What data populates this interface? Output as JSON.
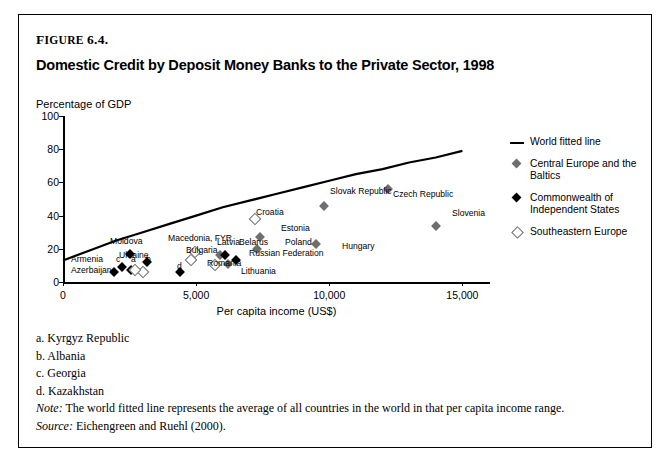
{
  "figure": {
    "number_prefix": "F",
    "number_rest": "IGURE",
    "number": "6.4.",
    "title": "Domestic Credit by Deposit Money Banks to the Private Sector, 1998"
  },
  "footnotes": [
    "a. Kyrgyz Republic",
    "b. Albania",
    "c. Georgia",
    "d. Kazakhstan"
  ],
  "note_label": "Note:",
  "note_text": " The world fitted line represents the average of all countries in the world in that per capita income range.",
  "source_label": "Source:",
  "source_text": " Eichengreen and Ruehl (2000).",
  "colors": {
    "central_europe": "#6e6e6e",
    "cis": "#000000",
    "southeastern_europe": "#ffffff",
    "southeastern_europe_border": "#6b6b6b",
    "fitted_line": "#000000"
  },
  "chart_data": {
    "type": "scatter",
    "title": "Domestic Credit by Deposit Money Banks to the Private Sector, 1998",
    "ylabel": "Percentage of GDP",
    "xlabel": "Per capita income (US$)",
    "xlim": [
      0,
      16000
    ],
    "ylim": [
      0,
      100
    ],
    "xticks": [
      0,
      5000,
      10000,
      15000
    ],
    "xticklabels": [
      "0",
      "5,000",
      "10,000",
      "15,000"
    ],
    "yticks": [
      0,
      20,
      40,
      60,
      80,
      100
    ],
    "yticklabels": [
      "0",
      "20",
      "40",
      "60",
      "80",
      "100"
    ],
    "grid": false,
    "legend_position": "right",
    "legend": [
      {
        "name": "World fitted line",
        "marker": "line"
      },
      {
        "name": "Central Europe and the Baltics",
        "marker": "diamond-gray"
      },
      {
        "name": "Commonwealth of Independent States",
        "marker": "diamond-black"
      },
      {
        "name": "Southeastern Europe",
        "marker": "diamond-open"
      }
    ],
    "fitted_line": {
      "name": "World fitted line",
      "x": [
        0,
        1000,
        2000,
        3000,
        4000,
        5000,
        6000,
        7000,
        8000,
        9000,
        10000,
        11000,
        12000,
        13000,
        14000,
        15000
      ],
      "y": [
        13,
        19,
        25,
        30,
        35,
        40,
        45,
        49,
        53,
        57,
        61,
        65,
        68,
        72,
        75,
        79
      ]
    },
    "series": [
      {
        "name": "Central Europe and the Baltics",
        "marker": "diamond-gray",
        "points": [
          {
            "label": "Latvia",
            "x": 5900,
            "y": 16
          },
          {
            "label": "Poland",
            "x": 7300,
            "y": 20
          },
          {
            "label": "Estonia",
            "x": 7400,
            "y": 27
          },
          {
            "label": "Hungary",
            "x": 9500,
            "y": 23
          },
          {
            "label": "Slovak Republic",
            "x": 9800,
            "y": 46
          },
          {
            "label": "Czech Republic",
            "x": 12200,
            "y": 56
          },
          {
            "label": "Slovenia",
            "x": 14000,
            "y": 34
          },
          {
            "label": "Lithuania",
            "x": 6200,
            "y": 11
          }
        ]
      },
      {
        "name": "Commonwealth of Independent States",
        "marker": "diamond-black",
        "points": [
          {
            "label": "Azerbaijan",
            "x": 1900,
            "y": 6
          },
          {
            "label": "Armenia",
            "x": 2200,
            "y": 9
          },
          {
            "label": "a",
            "x": 2550,
            "y": 7
          },
          {
            "label": "Moldova",
            "x": 2500,
            "y": 17
          },
          {
            "label": "Ukraine",
            "x": 3150,
            "y": 12
          },
          {
            "label": "d",
            "x": 4400,
            "y": 6
          },
          {
            "label": "Belarus",
            "x": 6100,
            "y": 16
          },
          {
            "label": "Russian Federation",
            "x": 6500,
            "y": 13
          }
        ]
      },
      {
        "name": "Southeastern Europe",
        "marker": "diamond-open",
        "points": [
          {
            "label": "b",
            "x": 3000,
            "y": 6
          },
          {
            "label": "c",
            "x": 2700,
            "y": 7
          },
          {
            "label": "Macedonia, FYR",
            "x": 4950,
            "y": 18
          },
          {
            "label": "Bulgaria",
            "x": 4800,
            "y": 13
          },
          {
            "label": "Romania",
            "x": 5700,
            "y": 10
          },
          {
            "label": "Croatia",
            "x": 7200,
            "y": 38
          }
        ]
      }
    ],
    "point_labels": [
      {
        "text": "Percentage of GDP",
        "role": "axis"
      },
      {
        "text": "World fitted line",
        "role": "legend"
      }
    ]
  },
  "annotations": [
    {
      "id": "armenia",
      "text": "Armenia",
      "x": 71,
      "y": 254
    },
    {
      "id": "azerbaijan",
      "text": "Azerbaijan",
      "x": 71,
      "y": 265
    },
    {
      "id": "a",
      "text": "a",
      "x": 131,
      "y": 254
    },
    {
      "id": "b",
      "text": "b",
      "x": 146,
      "y": 254
    },
    {
      "id": "c",
      "text": "c",
      "x": 116,
      "y": 254
    },
    {
      "id": "d",
      "text": "d",
      "x": 177,
      "y": 261
    },
    {
      "id": "moldova",
      "text": "Moldova",
      "x": 110,
      "y": 236
    },
    {
      "id": "ukraine",
      "text": "Ukraine",
      "x": 119,
      "y": 250
    },
    {
      "id": "macedonia",
      "text": "Macedonia, FYR",
      "x": 168,
      "y": 233
    },
    {
      "id": "bulgaria",
      "text": "Bulgaria",
      "x": 186,
      "y": 245
    },
    {
      "id": "latvia",
      "text": "Latvia",
      "x": 217,
      "y": 237
    },
    {
      "id": "belarus",
      "text": "Belarus",
      "x": 239,
      "y": 237
    },
    {
      "id": "romania",
      "text": "Romania",
      "x": 207,
      "y": 258
    },
    {
      "id": "lithuania",
      "text": "Lithuania",
      "x": 241,
      "y": 266
    },
    {
      "id": "russian-federation",
      "text": "Russian Federation",
      "x": 249,
      "y": 248
    },
    {
      "id": "estonia",
      "text": "Estonia",
      "x": 281,
      "y": 223
    },
    {
      "id": "poland",
      "text": "Poland",
      "x": 285,
      "y": 237
    },
    {
      "id": "croatia",
      "text": "Croatia",
      "x": 256,
      "y": 207
    },
    {
      "id": "hungary",
      "text": "Hungary",
      "x": 342,
      "y": 241
    },
    {
      "id": "slovak-republic",
      "text": "Slovak Republic",
      "x": 330,
      "y": 186
    },
    {
      "id": "czech-republic",
      "text": "Czech Republic",
      "x": 393,
      "y": 189
    },
    {
      "id": "slovenia",
      "text": "Slovenia",
      "x": 452,
      "y": 208
    }
  ]
}
